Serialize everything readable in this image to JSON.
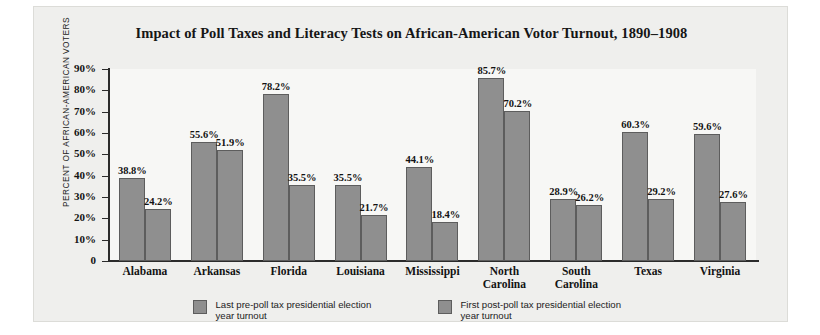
{
  "chart_data": {
    "type": "bar",
    "title": "Impact of Poll Taxes and Literacy Tests on African-American Votor Turnout, 1890–1908",
    "xlabel": "",
    "ylabel": "PERCENT OF AFRICAN-AMERICAN VOTERS",
    "ylim": [
      0,
      90
    ],
    "grid": false,
    "legend_position": "bottom-center",
    "ytick_labels": [
      "90%",
      "80%",
      "70%",
      "60%",
      "50%",
      "40%",
      "30%",
      "20%",
      "10%",
      "0"
    ],
    "ytick_values": [
      90,
      80,
      70,
      60,
      50,
      40,
      30,
      20,
      10,
      0
    ],
    "categories": [
      "Alabama",
      "Arkansas",
      "Florida",
      "Louisiana",
      "Mississippi",
      "North Carolina",
      "South Carolina",
      "Texas",
      "Virginia"
    ],
    "series": [
      {
        "name": "Last pre-poll tax presidential election year turnout",
        "color": "#8f8f8f",
        "values": [
          38.8,
          55.6,
          78.2,
          35.5,
          44.1,
          85.7,
          28.9,
          60.3,
          59.6
        ],
        "labels": [
          "38.8%",
          "55.6%",
          "78.2%",
          "35.5%",
          "44.1%",
          "85.7%",
          "28.9%",
          "60.3%",
          "59.6%"
        ]
      },
      {
        "name": "First post-poll tax presidential election year turnout",
        "color": "#8f8f8f",
        "values": [
          24.2,
          51.9,
          35.5,
          21.7,
          18.4,
          70.2,
          26.2,
          29.2,
          27.6
        ],
        "labels": [
          "24.2%",
          "51.9%",
          "35.5%",
          "21.7%",
          "18.4%",
          "70.2%",
          "26.2%",
          "29.2%",
          "27.6%"
        ]
      }
    ]
  },
  "legend": {
    "items": [
      {
        "label": "Last pre-poll tax presidential election year turnout",
        "swatch_color": "#8f8f8f"
      },
      {
        "label": "First post-poll tax presidential election year turnout",
        "swatch_color": "#8f8f8f"
      }
    ]
  },
  "colors": {
    "bar_fill": "#8f8f8f",
    "bar_stroke": "#5d5d5d",
    "axis": "#2b2b2b",
    "card_background": "#efefed",
    "plot_background": "#f7f7f5",
    "text": "#141414"
  }
}
